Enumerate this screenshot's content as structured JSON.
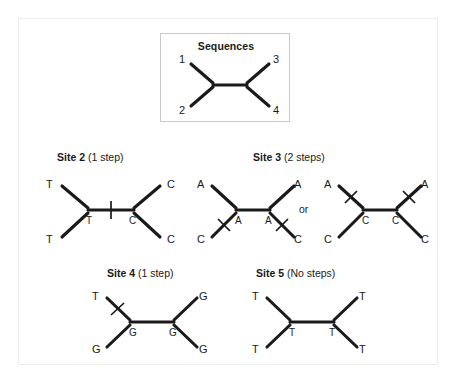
{
  "figure": {
    "background_color": "#ffffff",
    "line_color": "#1a1a1a",
    "frame_color": "#ededed",
    "box_border_color": "#c9c9c9"
  },
  "sequences_box": {
    "title": "Sequences",
    "tips": {
      "top_left": "1",
      "bottom_left": "2",
      "top_right": "3",
      "bottom_right": "4"
    }
  },
  "panels": [
    {
      "id": "site-2",
      "title_bold": "Site 2",
      "title_rest": "(1 step)",
      "trees": [
        {
          "tips": {
            "top_left": "T",
            "bottom_left": "T",
            "top_right": "C",
            "bottom_right": "C"
          },
          "internal": {
            "left": "T",
            "right": "C"
          },
          "ticks": [
            "internal-branch"
          ]
        }
      ]
    },
    {
      "id": "site-3",
      "title_bold": "Site 3",
      "title_rest": "(2 steps)",
      "connector": "or",
      "trees": [
        {
          "tips": {
            "top_left": "A",
            "bottom_left": "C",
            "top_right": "A",
            "bottom_right": "C"
          },
          "internal": {
            "left": "A",
            "right": "A"
          },
          "ticks": [
            "bottom-left-branch",
            "bottom-right-branch"
          ]
        },
        {
          "tips": {
            "top_left": "A",
            "bottom_left": "C",
            "top_right": "A",
            "bottom_right": "C"
          },
          "internal": {
            "left": "C",
            "right": "C"
          },
          "ticks": [
            "top-left-branch",
            "top-right-branch"
          ]
        }
      ]
    },
    {
      "id": "site-4",
      "title_bold": "Site 4",
      "title_rest": "(1 step)",
      "trees": [
        {
          "tips": {
            "top_left": "T",
            "bottom_left": "G",
            "top_right": "G",
            "bottom_right": "G"
          },
          "internal": {
            "left": "G",
            "right": "G"
          },
          "ticks": [
            "top-left-branch"
          ]
        }
      ]
    },
    {
      "id": "site-5",
      "title_bold": "Site 5",
      "title_rest": "(No steps)",
      "trees": [
        {
          "tips": {
            "top_left": "T",
            "bottom_left": "T",
            "top_right": "T",
            "bottom_right": "T"
          },
          "internal": {
            "left": "T",
            "right": "T"
          },
          "ticks": []
        }
      ]
    }
  ]
}
